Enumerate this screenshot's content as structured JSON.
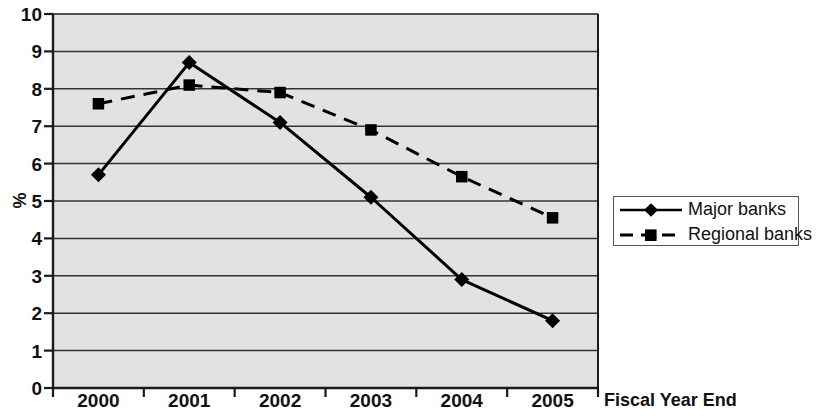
{
  "chart_data": {
    "type": "line",
    "title": "",
    "xlabel": "Fiscal Year End",
    "ylabel": "%",
    "categories": [
      "2000",
      "2001",
      "2002",
      "2003",
      "2004",
      "2005"
    ],
    "ylim": [
      0,
      10
    ],
    "ytick_labels": [
      "0",
      "1",
      "2",
      "3",
      "4",
      "5",
      "6",
      "7",
      "8",
      "9",
      "10"
    ],
    "yticks": [
      0,
      1,
      2,
      3,
      4,
      5,
      6,
      7,
      8,
      9,
      10
    ],
    "grid": true,
    "grid_axis": "y",
    "legend_position": "right",
    "plot_background": "#e2e2e2",
    "series": [
      {
        "name": "Major banks",
        "values": [
          5.7,
          8.7,
          7.1,
          5.1,
          2.9,
          1.8
        ],
        "marker": "diamond",
        "line_style": "solid",
        "color": "#000000"
      },
      {
        "name": "Regional banks",
        "values": [
          7.6,
          8.1,
          7.9,
          6.9,
          5.65,
          4.55
        ],
        "marker": "square",
        "line_style": "dashed",
        "color": "#000000"
      }
    ]
  },
  "legend": {
    "entries": [
      {
        "label": "Major banks"
      },
      {
        "label": "Regional banks"
      }
    ]
  }
}
